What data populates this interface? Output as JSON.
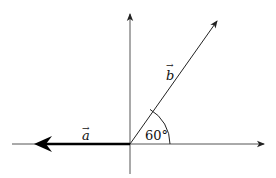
{
  "diagram": {
    "type": "vector-angle-diagram",
    "axes": {
      "horizontal": {
        "from": [
          12,
          144
        ],
        "to": [
          266,
          144
        ],
        "arrowhead": "right"
      },
      "vertical": {
        "from": [
          130,
          174
        ],
        "to": [
          130,
          12
        ],
        "arrowhead": "up"
      }
    },
    "origin": [
      130,
      144
    ],
    "vectors": [
      {
        "id": "a",
        "label": "a",
        "arrow_accent": "→",
        "from": [
          130,
          144
        ],
        "to": [
          34,
          144
        ],
        "weight": "bold",
        "color": "#000000"
      },
      {
        "id": "b",
        "label": "b",
        "arrow_accent": "→",
        "from": [
          130,
          144
        ],
        "to": [
          218,
          19
        ],
        "weight": "normal",
        "color": "#222222"
      }
    ],
    "angle": {
      "label": "60°",
      "radius": 40,
      "between": [
        "positive x-axis",
        "b"
      ]
    },
    "colors": {
      "line": "#222222",
      "axis": "#444444",
      "background": "#ffffff"
    }
  }
}
